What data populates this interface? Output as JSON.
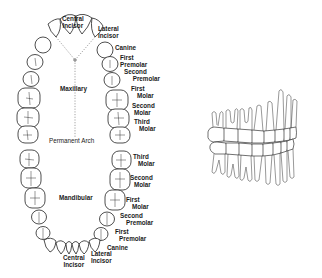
{
  "diagram": {
    "title": "Permanent Arch",
    "maxillary": {
      "label": "Maxillary",
      "teeth": [
        {
          "line1": "Central",
          "line2": "Incisor"
        },
        {
          "line1": "Lateral",
          "line2": "Incisor"
        },
        {
          "line1": "Canine",
          "line2": ""
        },
        {
          "line1": "First",
          "line2": "Premolar"
        },
        {
          "line1": "Second",
          "line2": "Premolar"
        },
        {
          "line1": "First",
          "line2": "Molar"
        },
        {
          "line1": "Second",
          "line2": "Molar"
        },
        {
          "line1": "Third",
          "line2": "Molar"
        }
      ]
    },
    "mandibular": {
      "label": "Mandibular",
      "teeth": [
        {
          "line1": "Third",
          "line2": "Molar"
        },
        {
          "line1": "Second",
          "line2": "Molar"
        },
        {
          "line1": "First",
          "line2": "Molar"
        },
        {
          "line1": "Second",
          "line2": "Premolar"
        },
        {
          "line1": "First",
          "line2": "Premolar"
        },
        {
          "line1": "Canine",
          "line2": ""
        },
        {
          "line1": "Central",
          "line2": "Incisor"
        },
        {
          "line1": "Lateral",
          "line2": "Incisor"
        }
      ]
    },
    "side_view": {
      "label": "Lateral view of occluded permanent dentition"
    }
  }
}
